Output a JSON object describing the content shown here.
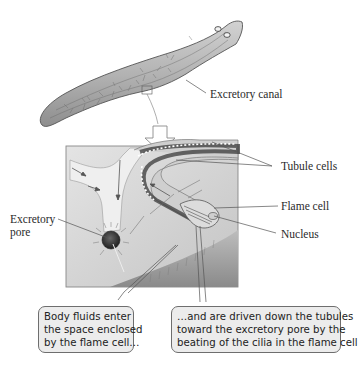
{
  "figure": {
    "labels": {
      "excretory_canal": "Excretory canal",
      "tubule_cells": "Tubule cells",
      "flame_cell": "Flame cell",
      "nucleus": "Nucleus",
      "excretory_pore_line1": "Excretory",
      "excretory_pore_line2": "pore"
    },
    "callouts": [
      {
        "lines": [
          "Body fluids enter",
          "the space enclosed",
          "by the flame cell…"
        ]
      },
      {
        "lines": [
          "…and are driven down the tubules",
          "toward the excretory pore by the",
          "beating of the cilia in the flame cell."
        ]
      }
    ],
    "colors": {
      "callout_fill": "#ececec",
      "callout_border": "#6e6e6e",
      "body_fill": "#b8b8b8",
      "inset_bg": "#d4d4d4"
    }
  }
}
